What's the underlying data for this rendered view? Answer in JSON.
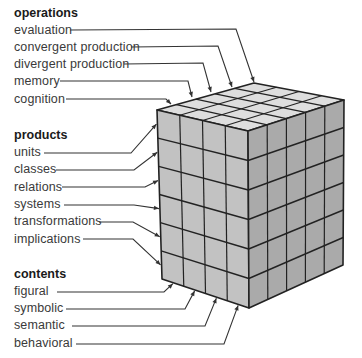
{
  "diagram": {
    "type": "structure-of-intellect-cube",
    "colors": {
      "top_face": "#dedede",
      "left_face": "#c2c2c2",
      "right_face": "#aaaaaa",
      "grid_lines": "#222222",
      "leader_lines": "#333333",
      "text": "#3a3a3a"
    },
    "groups": [
      {
        "header": "operations",
        "items": [
          "evaluation",
          "convergent production",
          "divergent production",
          "memory",
          "cognition"
        ]
      },
      {
        "header": "products",
        "items": [
          "units",
          "classes",
          "relations",
          "systems",
          "transformations",
          "implications"
        ]
      },
      {
        "header": "contents",
        "items": [
          "figural",
          "symbolic",
          "semantic",
          "behavioral"
        ]
      }
    ],
    "cube": {
      "left_face_columns": 4,
      "right_face_columns": 5,
      "rows": 6
    }
  }
}
